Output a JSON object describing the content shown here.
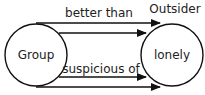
{
  "diagram": {
    "nodes": {
      "group": {
        "label": "Group"
      },
      "outsider": {
        "label": "lonely",
        "caption": "Outsider"
      }
    },
    "edges": {
      "top_label": "better than",
      "bottom_label": "suspicious of"
    },
    "colors": {
      "stroke": "#111111",
      "background": "#ffffff"
    }
  }
}
